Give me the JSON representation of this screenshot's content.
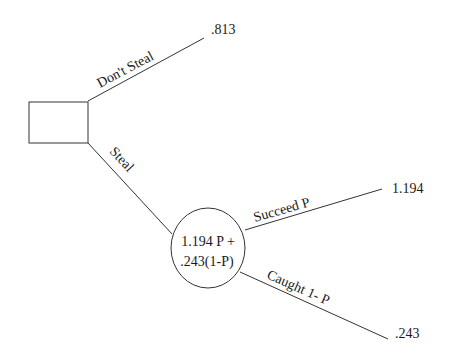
{
  "diagram": {
    "type": "decision-tree",
    "decision_node": {
      "shape": "rectangle",
      "label": ""
    },
    "branches": [
      {
        "label": "Don't Steal",
        "payoff": ".813"
      },
      {
        "label": "Steal",
        "leads_to": "chance_node"
      }
    ],
    "chance_node": {
      "shape": "circle",
      "label_line1": "1.194 P +",
      "label_line2": ".243(1-P)",
      "branches": [
        {
          "label": "Succeed P",
          "payoff": "1.194"
        },
        {
          "label": "Caught 1- P",
          "payoff": ".243"
        }
      ]
    }
  }
}
